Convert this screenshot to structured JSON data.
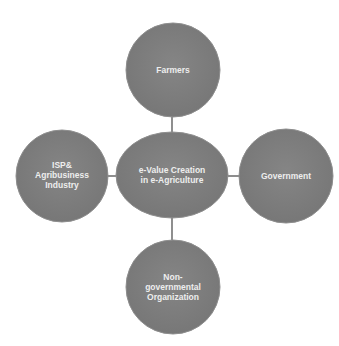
{
  "diagram": {
    "type": "hub-and-spoke",
    "center": {
      "id": "center",
      "lines": [
        "e-Value Creation",
        "in e-Agriculture"
      ]
    },
    "nodes": [
      {
        "id": "top",
        "lines": [
          "Farmers"
        ]
      },
      {
        "id": "left",
        "lines": [
          "ISP&",
          "Agribusiness",
          "Industry"
        ]
      },
      {
        "id": "right",
        "lines": [
          "Government"
        ]
      },
      {
        "id": "bottom",
        "lines": [
          "Non-",
          "governmental",
          "Organization"
        ]
      }
    ],
    "colors": {
      "node_fill": "#7d7d7d",
      "node_edge": "#8e8e8e",
      "connector": "#444444",
      "label": "#eeeeee"
    }
  }
}
